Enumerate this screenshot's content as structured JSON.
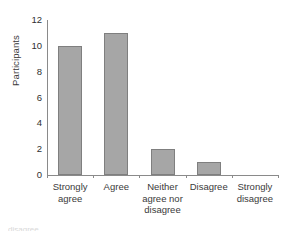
{
  "chart_data": {
    "type": "bar",
    "title": "",
    "subtitle": "",
    "xlabel": "",
    "ylabel": "Participants",
    "categories": [
      "Strongly\nagree",
      "Agree",
      "Neither\nagree nor\ndisagree",
      "Disagree",
      "Strongly\ndisagree"
    ],
    "values": [
      10,
      11,
      2,
      1,
      0
    ],
    "ylim": [
      0,
      12
    ],
    "yticks": [
      0,
      2,
      4,
      6,
      8,
      10,
      12
    ],
    "ytick_labels": [
      "0",
      "2",
      "4",
      "6",
      "8",
      "10",
      "12"
    ],
    "grid": false,
    "legend": false,
    "legend_position": "none",
    "bar_fill_color": "#a6a6a6",
    "bar_border_color": "#7f7f7f",
    "axis_color": "#8a8a8a",
    "text_color": "#3a3a3a"
  },
  "caption": {
    "clipped_text": "disagree"
  }
}
